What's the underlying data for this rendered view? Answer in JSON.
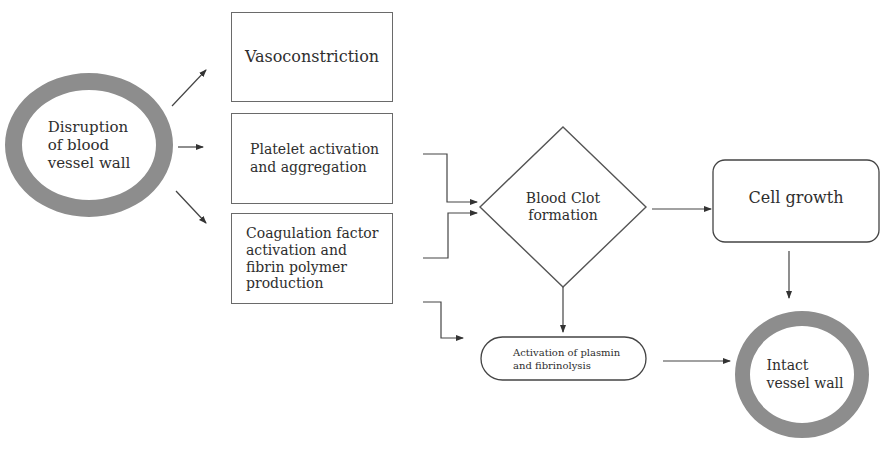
{
  "diagram": {
    "type": "flowchart",
    "colors": {
      "stroke": "#555555",
      "ring": "#8d8d8d",
      "text": "#2e2e2e",
      "background": "#ffffff"
    },
    "nodes": {
      "disruption": {
        "shape": "ring",
        "lines": [
          "Disruption",
          "of blood",
          "vessel wall"
        ]
      },
      "vasoconstriction": {
        "shape": "rectangle",
        "lines": [
          "Vasoconstriction"
        ]
      },
      "platelet": {
        "shape": "rectangle",
        "lines": [
          "Platelet activation",
          "and aggregation"
        ]
      },
      "coagulation": {
        "shape": "rectangle",
        "lines": [
          "Coagulation factor",
          "activation and",
          "fibrin polymer",
          "production"
        ]
      },
      "clot": {
        "shape": "diamond",
        "lines": [
          "Blood Clot",
          "formation"
        ]
      },
      "cell_growth": {
        "shape": "rounded-rectangle",
        "lines": [
          "Cell growth"
        ]
      },
      "plasmin": {
        "shape": "pill",
        "lines": [
          "Activation of plasmin",
          "and fibrinolysis"
        ]
      },
      "intact": {
        "shape": "ring",
        "lines": [
          "Intact",
          "vessel wall"
        ]
      }
    },
    "edges": [
      {
        "from": "disruption",
        "to": "vasoconstriction"
      },
      {
        "from": "disruption",
        "to": "platelet"
      },
      {
        "from": "disruption",
        "to": "coagulation"
      },
      {
        "from": "platelet",
        "to": "clot"
      },
      {
        "from": "coagulation",
        "to": "clot"
      },
      {
        "from": "coagulation",
        "to": "plasmin"
      },
      {
        "from": "clot",
        "to": "cell_growth"
      },
      {
        "from": "clot",
        "to": "plasmin"
      },
      {
        "from": "cell_growth",
        "to": "intact"
      },
      {
        "from": "plasmin",
        "to": "intact"
      }
    ]
  }
}
